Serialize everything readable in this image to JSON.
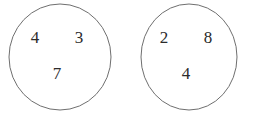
{
  "figure": {
    "type": "number-groups-diagram",
    "background_color": "#ffffff",
    "stroke_color": "#6f6f6f",
    "digit_color": "#2b2b2b",
    "groups": [
      {
        "name": "left-circle",
        "shape": "circle",
        "center_x": 60,
        "center_y": 57,
        "radius_x": 51,
        "radius_y": 53,
        "numbers": [
          {
            "value": "4",
            "x": 35,
            "y": 37
          },
          {
            "value": "3",
            "x": 79,
            "y": 37
          },
          {
            "value": "7",
            "x": 57,
            "y": 73
          }
        ]
      },
      {
        "name": "right-circle",
        "shape": "circle",
        "center_x": 189,
        "center_y": 57,
        "radius_x": 48,
        "radius_y": 53,
        "numbers": [
          {
            "value": "2",
            "x": 164,
            "y": 37
          },
          {
            "value": "8",
            "x": 208,
            "y": 37
          },
          {
            "value": "4",
            "x": 186,
            "y": 73
          }
        ]
      }
    ]
  }
}
